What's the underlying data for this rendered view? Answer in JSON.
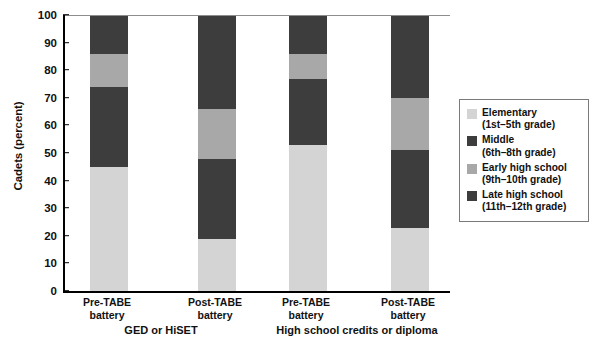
{
  "chart_data": {
    "type": "bar",
    "subtype": "stacked-column-100",
    "title": "",
    "xlabel": "",
    "ylabel": "Cadets (percent)",
    "ylim": [
      0,
      100
    ],
    "yticks": [
      0,
      10,
      20,
      30,
      40,
      50,
      60,
      70,
      80,
      90,
      100
    ],
    "grid": false,
    "legend_position": "right",
    "categories": [
      "Pre-TABE battery",
      "Post-TABE battery",
      "Pre-TABE battery",
      "Post-TABE battery"
    ],
    "groups": [
      {
        "label": "GED or HiSET",
        "categories": [
          "Pre-TABE battery",
          "Post-TABE battery"
        ]
      },
      {
        "label": "High school credits or diploma",
        "categories": [
          "Pre-TABE battery",
          "Post-TABE battery"
        ]
      }
    ],
    "series": [
      {
        "name": "Elementary (1st–5th grade)",
        "color": "#d4d4d4",
        "values": [
          45,
          19,
          53,
          23
        ]
      },
      {
        "name": "Middle (6th–8th grade)",
        "color": "#3d3d3d",
        "values": [
          29,
          29,
          24,
          28
        ]
      },
      {
        "name": "Early high school (9th–10th grade)",
        "color": "#a8a8a8",
        "values": [
          12,
          18,
          9,
          19
        ]
      },
      {
        "name": "Late high school (11th–12th grade)",
        "color": "#3d3d3d",
        "values": [
          14,
          34,
          14,
          30
        ]
      }
    ]
  },
  "axis": {
    "y_title": "Cadets (percent)",
    "y_tick_labels": [
      "100",
      "90",
      "80",
      "70",
      "60",
      "50",
      "40",
      "30",
      "20",
      "10",
      "0"
    ]
  },
  "x_axis": {
    "ticks": [
      {
        "line1": "Pre-TABE",
        "line2": "battery"
      },
      {
        "line1": "Post-TABE",
        "line2": "battery"
      },
      {
        "line1": "Pre-TABE",
        "line2": "battery"
      },
      {
        "line1": "Post-TABE",
        "line2": "battery"
      }
    ],
    "groups": [
      {
        "label": "GED or HiSET"
      },
      {
        "label": "High school credits or diploma"
      }
    ]
  },
  "legend": {
    "items": [
      {
        "label": "Elementary",
        "sub": "(1st–5th grade)",
        "color": "#d4d4d4"
      },
      {
        "label": "Middle",
        "sub": "(6th–8th grade)",
        "color": "#3d3d3d"
      },
      {
        "label": "Early high school",
        "sub": "(9th–10th grade)",
        "color": "#a8a8a8"
      },
      {
        "label": "Late high school",
        "sub": "(11th–12th grade)",
        "color": "#3d3d3d"
      }
    ]
  },
  "colors": {
    "elementary": "#d4d4d4",
    "middle": "#3d3d3d",
    "early_high_school": "#a8a8a8",
    "late_high_school": "#3d3d3d",
    "axis": "#000000",
    "legend_border": "#7a7a7a",
    "background": "#ffffff"
  }
}
